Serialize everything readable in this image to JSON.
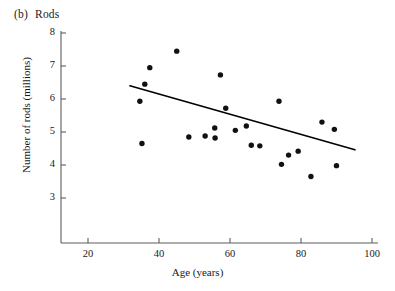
{
  "panel": {
    "tag": "(b)",
    "name": "Rods"
  },
  "chart_data": {
    "type": "scatter",
    "xlabel": "Age (years)",
    "ylabel": "Number of rods (millions)",
    "xlim": [
      12,
      105
    ],
    "ylim": [
      2.4,
      8.1
    ],
    "xticks": [
      20,
      40,
      60,
      80,
      100
    ],
    "xtick_labels": [
      "20",
      "40",
      "60",
      "80",
      "100"
    ],
    "yticks": [
      3,
      4,
      5,
      6,
      7,
      8
    ],
    "ytick_labels": [
      "3",
      "4",
      "5",
      "6",
      "7",
      "8"
    ],
    "grid": false,
    "legend": null,
    "points": [
      {
        "x": 34.6,
        "y": 5.93
      },
      {
        "x": 35.2,
        "y": 4.65
      },
      {
        "x": 37.4,
        "y": 6.95
      },
      {
        "x": 36.0,
        "y": 6.45
      },
      {
        "x": 45.0,
        "y": 7.45
      },
      {
        "x": 48.4,
        "y": 4.85
      },
      {
        "x": 53.0,
        "y": 4.88
      },
      {
        "x": 55.7,
        "y": 5.12
      },
      {
        "x": 55.8,
        "y": 4.82
      },
      {
        "x": 57.3,
        "y": 6.73
      },
      {
        "x": 58.8,
        "y": 5.72
      },
      {
        "x": 61.5,
        "y": 5.05
      },
      {
        "x": 64.6,
        "y": 5.18
      },
      {
        "x": 66.0,
        "y": 4.6
      },
      {
        "x": 68.4,
        "y": 4.58
      },
      {
        "x": 73.8,
        "y": 5.93
      },
      {
        "x": 74.5,
        "y": 4.02
      },
      {
        "x": 76.5,
        "y": 4.3
      },
      {
        "x": 79.2,
        "y": 4.42
      },
      {
        "x": 82.8,
        "y": 3.65
      },
      {
        "x": 85.9,
        "y": 5.3
      },
      {
        "x": 89.4,
        "y": 5.08
      },
      {
        "x": 90.0,
        "y": 3.98
      }
    ],
    "fit_line": {
      "type": "linear-regression",
      "x_start": 31.8,
      "y_start": 6.4,
      "x_end": 95.2,
      "y_end": 4.46
    }
  }
}
